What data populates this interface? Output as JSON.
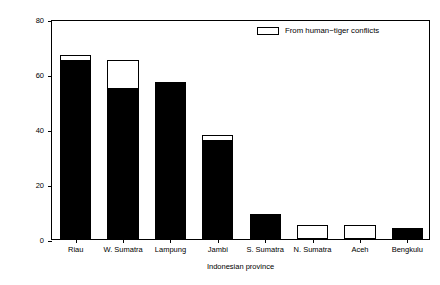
{
  "chart_data": {
    "type": "bar",
    "title": "",
    "subtitle": "",
    "xlabel": "Indonesian province",
    "ylabel": "Number of tigers killed or captured",
    "categories": [
      "Riau",
      "W. Sumatra",
      "Lampung",
      "Jambi",
      "S. Sumatra",
      "N. Sumatra",
      "Aceh",
      "Bengkulu"
    ],
    "series": [
      {
        "name": "Total killed or captured",
        "values": [
          67,
          65,
          57,
          38,
          9,
          5,
          5,
          4
        ]
      },
      {
        "name": "From human-tiger conflicts",
        "values": [
          2,
          10,
          0,
          2,
          0,
          5,
          5,
          0
        ]
      }
    ],
    "stacked_segments": {
      "solid_black_values": [
        65,
        55,
        57,
        36,
        9,
        0,
        0,
        4
      ],
      "white_top_values": [
        2,
        10,
        0,
        2,
        0,
        5,
        5,
        0
      ]
    },
    "ylim": [
      0,
      80
    ],
    "yticks": [
      0,
      20,
      40,
      60,
      80
    ],
    "ytick_labels": [
      "0",
      "20",
      "40",
      "60",
      "80"
    ],
    "grid": false,
    "legend": {
      "position": "top-center-right",
      "entries": [
        {
          "label": "From human−tiger conflicts",
          "swatch": "white-rectangle",
          "fill": "#ffffff",
          "edge": "#000000"
        }
      ]
    },
    "colors": {
      "bar_fill": "#000000",
      "bar_edge": "#000000",
      "conflict_fill": "#ffffff",
      "background": "#ffffff",
      "axis": "#000000"
    }
  }
}
